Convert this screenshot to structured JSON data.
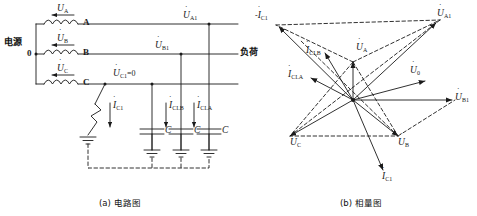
{
  "figure": {
    "caption_a": "(a) 电路图",
    "caption_b": "(b) 相量图"
  },
  "circuit": {
    "source_label": "电源",
    "neutral_label": "0",
    "load_label": "负荷",
    "phase_A": "A",
    "phase_B": "B",
    "phase_C": "C",
    "source_voltages": [
      {
        "symbol": "U",
        "sub": "A"
      },
      {
        "symbol": "U",
        "sub": "B"
      },
      {
        "symbol": "U",
        "sub": "C"
      }
    ],
    "line_voltages": [
      {
        "symbol": "U",
        "sub": "A1",
        "value": ""
      },
      {
        "symbol": "U",
        "sub": "B1",
        "value": ""
      },
      {
        "symbol": "U",
        "sub": "C1",
        "value": "=0"
      }
    ],
    "fault_current": {
      "symbol": "I",
      "sub": "C1"
    },
    "cap_currents": [
      {
        "symbol": "I",
        "sub": "CI.B"
      },
      {
        "symbol": "I",
        "sub": "CI.A"
      }
    ],
    "capacitor_labels": [
      "C",
      "C",
      "C"
    ]
  },
  "phasor": {
    "labels": [
      {
        "id": "neg-ic1",
        "prefix": "-",
        "symbol": "I",
        "sub": "C1"
      },
      {
        "id": "ua1",
        "prefix": "",
        "symbol": "U",
        "sub": "A1"
      },
      {
        "id": "icib",
        "prefix": "",
        "symbol": "I",
        "sub": "CI.B"
      },
      {
        "id": "ua",
        "prefix": "",
        "symbol": "U",
        "sub": "A"
      },
      {
        "id": "icia",
        "prefix": "",
        "symbol": "I",
        "sub": "CI.A"
      },
      {
        "id": "ub",
        "prefix": "",
        "symbol": "U",
        "sub": "0"
      },
      {
        "id": "ub1",
        "prefix": "",
        "symbol": "U",
        "sub": "B1"
      },
      {
        "id": "uc",
        "prefix": "",
        "symbol": "U",
        "sub": "C"
      },
      {
        "id": "ubb",
        "prefix": "",
        "symbol": "U",
        "sub": "B"
      },
      {
        "id": "ic1",
        "prefix": "",
        "symbol": "I",
        "sub": "C1"
      }
    ]
  },
  "style": {
    "line_color": "#1a1a1a",
    "bg": "#ffffff"
  }
}
